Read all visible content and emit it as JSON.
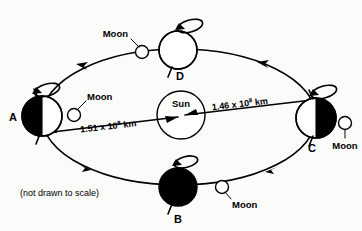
{
  "figure": {
    "note": "(not drawn to scale)",
    "sun_label": "Sun",
    "moon_label": "Moon"
  },
  "sun": {
    "label": "Sun",
    "cx": 181,
    "cy": 115,
    "r": 24
  },
  "positions": [
    {
      "id": "A",
      "label": "A",
      "cx": 42,
      "cy": 116,
      "r": 20,
      "shading": "left-half-dark",
      "moon_label": "Moon",
      "moon_cx": 74,
      "moon_cy": 115,
      "moon_r": 6.5
    },
    {
      "id": "B",
      "label": "B",
      "cx": 178,
      "cy": 187,
      "r": 19,
      "shading": "full-dark",
      "moon_label": "Moon",
      "moon_cx": 222,
      "moon_cy": 187,
      "moon_r": 6.5
    },
    {
      "id": "C",
      "label": "C",
      "cx": 316,
      "cy": 118,
      "r": 20,
      "shading": "right-half-dark",
      "moon_label": "Moon",
      "moon_cx": 345,
      "moon_cy": 123,
      "moon_r": 6.5
    },
    {
      "id": "D",
      "label": "D",
      "cx": 178,
      "cy": 50,
      "r": 19,
      "shading": "none",
      "moon_label": "Moon",
      "moon_cx": 142,
      "moon_cy": 52,
      "moon_r": 6.5
    }
  ],
  "distances": [
    {
      "id": "aphelion-left",
      "mantissa": "1.51 x 10",
      "exponent": "8",
      "unit": " km",
      "from": "A",
      "to": "Sun"
    },
    {
      "id": "perihelion-right",
      "mantissa": "1.46 x 10",
      "exponent": "8",
      "unit": " km",
      "from": "Sun",
      "to": "C"
    }
  ],
  "orbit": {
    "direction": "counterclockwise",
    "arrow_count": 4
  },
  "colors": {
    "ink": "#000000",
    "paper": "#fbfbfa",
    "shadow_fill": "#000000",
    "lit_fill": "#ffffff"
  }
}
